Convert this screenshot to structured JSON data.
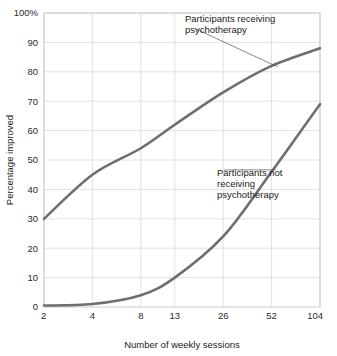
{
  "chart_data": {
    "type": "line",
    "title": "",
    "subtitle": "",
    "xlabel": "Number of weekly sessions",
    "ylabel": "Percentage improved",
    "x_tick_labels": [
      "2",
      "4",
      "8",
      "13",
      "26",
      "52",
      "104"
    ],
    "x_tick_values": [
      2,
      4,
      8,
      13,
      26,
      52,
      104
    ],
    "x_scale": "log",
    "xlim": [
      2,
      104
    ],
    "y_tick_labels": [
      "0",
      "10",
      "20",
      "30",
      "40",
      "50",
      "60",
      "70",
      "80",
      "90",
      "100%"
    ],
    "y_tick_values": [
      0,
      10,
      20,
      30,
      40,
      50,
      60,
      70,
      80,
      90,
      100
    ],
    "ylim": [
      0,
      100
    ],
    "grid": true,
    "legend_position": "inline-annotations",
    "series": [
      {
        "name": "Participants receiving psychotherapy",
        "color": "#6e6e6e",
        "x": [
          2,
          4,
          8,
          13,
          26,
          52,
          104
        ],
        "values": [
          30,
          45,
          54,
          62,
          73,
          82,
          88
        ]
      },
      {
        "name": "Participants not receiving psychotherapy",
        "color": "#6e6e6e",
        "x": [
          2,
          4,
          8,
          13,
          26,
          52,
          104
        ],
        "values": [
          0.5,
          1,
          4,
          10,
          24,
          46,
          69
        ]
      }
    ],
    "annotations": [
      {
        "id": "annotation-upper",
        "lines": [
          "Participants receiving",
          "psychotherapy"
        ],
        "points_to_x": 52,
        "points_to_y": 82
      },
      {
        "id": "annotation-lower",
        "lines": [
          "Participants not",
          "receiving",
          "psychotherapy"
        ],
        "points_to_x": 52,
        "points_to_y": 46
      }
    ],
    "colors": {
      "line": "#6e6e6e",
      "grid": "#d9d9d9",
      "axis": "#c9c9c9",
      "text": "#1b1b1b"
    }
  }
}
